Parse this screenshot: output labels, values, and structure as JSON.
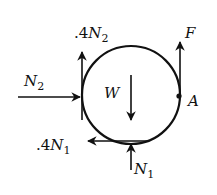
{
  "diagram": {
    "body": {
      "shape": "circle",
      "label": "W"
    },
    "forces": [
      {
        "id": "friction-wall",
        "coef": ".4",
        "symbol": "N",
        "sub": "2",
        "direction": "up"
      },
      {
        "id": "normal-wall",
        "symbol": "N",
        "sub": "2",
        "direction": "right"
      },
      {
        "id": "applied",
        "symbol": "F",
        "direction": "up"
      },
      {
        "id": "weight",
        "symbol": "W",
        "direction": "down"
      },
      {
        "id": "friction-floor",
        "coef": ".4",
        "symbol": "N",
        "sub": "1",
        "direction": "left"
      },
      {
        "id": "normal-floor",
        "symbol": "N",
        "sub": "1",
        "direction": "up"
      }
    ],
    "point": {
      "label": "A"
    },
    "colors": {
      "stroke": "#111111",
      "background": "#ffffff"
    }
  }
}
